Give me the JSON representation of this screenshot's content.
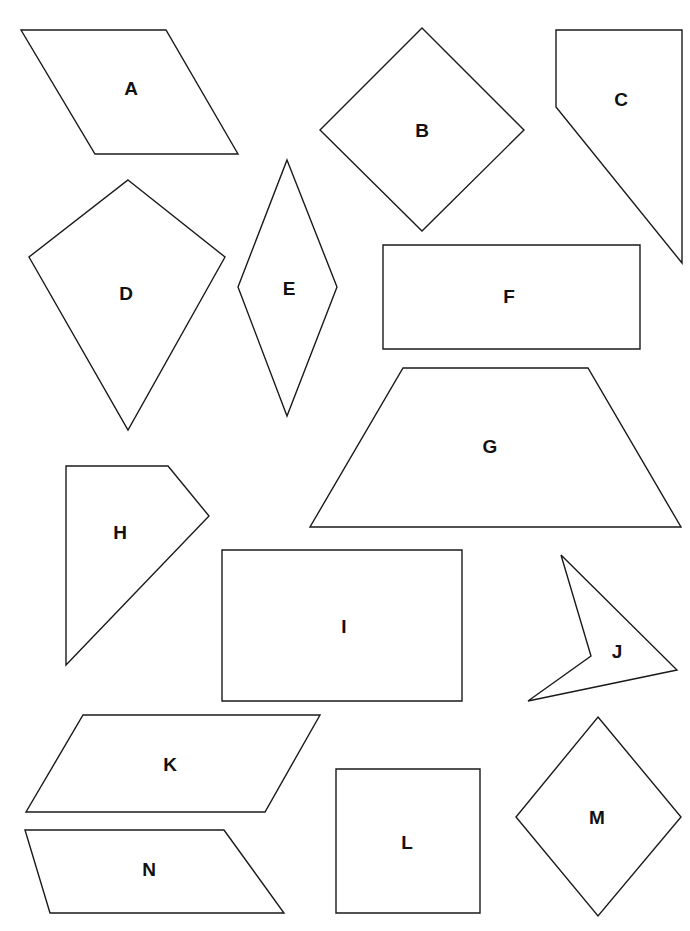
{
  "figure": {
    "width": 690,
    "height": 931,
    "background": "#ffffff",
    "stroke_color": "#1a1a1a",
    "label_color": "#111111"
  },
  "shapes": [
    {
      "label": "A",
      "kind": "parallelogram",
      "points": [
        [
          21,
          30
        ],
        [
          166,
          30
        ],
        [
          238,
          154
        ],
        [
          95,
          154
        ]
      ],
      "label_pos": [
        131,
        88
      ]
    },
    {
      "label": "B",
      "kind": "square-rotated",
      "points": [
        [
          422,
          28
        ],
        [
          524,
          130
        ],
        [
          422,
          231
        ],
        [
          320,
          130
        ]
      ],
      "label_pos": [
        422,
        130
      ]
    },
    {
      "label": "C",
      "kind": "quadrilateral",
      "points": [
        [
          556,
          30
        ],
        [
          682,
          30
        ],
        [
          682,
          263
        ],
        [
          556,
          107
        ]
      ],
      "label_pos": [
        621,
        99
      ]
    },
    {
      "label": "D",
      "kind": "kite",
      "points": [
        [
          128,
          180
        ],
        [
          225,
          257
        ],
        [
          128,
          430
        ],
        [
          29,
          257
        ]
      ],
      "label_pos": [
        126,
        293
      ]
    },
    {
      "label": "E",
      "kind": "rhombus",
      "points": [
        [
          287,
          160
        ],
        [
          337,
          287
        ],
        [
          287,
          416
        ],
        [
          238,
          287
        ]
      ],
      "label_pos": [
        289,
        288
      ]
    },
    {
      "label": "F",
      "kind": "rectangle",
      "points": [
        [
          383,
          245
        ],
        [
          640,
          245
        ],
        [
          640,
          349
        ],
        [
          383,
          349
        ]
      ],
      "label_pos": [
        509,
        296
      ]
    },
    {
      "label": "G",
      "kind": "trapezoid",
      "points": [
        [
          403,
          368
        ],
        [
          588,
          368
        ],
        [
          681,
          527
        ],
        [
          310,
          527
        ]
      ],
      "label_pos": [
        490,
        446
      ]
    },
    {
      "label": "H",
      "kind": "pentagon",
      "points": [
        [
          66,
          466
        ],
        [
          168,
          466
        ],
        [
          209,
          516
        ],
        [
          66,
          665
        ]
      ],
      "label_pos": [
        120,
        532
      ]
    },
    {
      "label": "I",
      "kind": "rectangle",
      "points": [
        [
          222,
          550
        ],
        [
          462,
          550
        ],
        [
          462,
          701
        ],
        [
          222,
          701
        ]
      ],
      "label_pos": [
        344,
        626
      ]
    },
    {
      "label": "J",
      "kind": "concave-quadrilateral",
      "points": [
        [
          561,
          555
        ],
        [
          677,
          670
        ],
        [
          528,
          701
        ],
        [
          591,
          656
        ]
      ],
      "label_pos": [
        617,
        651
      ]
    },
    {
      "label": "K",
      "kind": "parallelogram",
      "points": [
        [
          83,
          715
        ],
        [
          320,
          715
        ],
        [
          265,
          812
        ],
        [
          26,
          812
        ]
      ],
      "label_pos": [
        170,
        764
      ]
    },
    {
      "label": "L",
      "kind": "square",
      "points": [
        [
          336,
          769
        ],
        [
          480,
          769
        ],
        [
          480,
          913
        ],
        [
          336,
          913
        ]
      ],
      "label_pos": [
        407,
        842
      ]
    },
    {
      "label": "M",
      "kind": "rhombus",
      "points": [
        [
          598,
          717
        ],
        [
          681,
          817
        ],
        [
          598,
          916
        ],
        [
          516,
          817
        ]
      ],
      "label_pos": [
        597,
        817
      ]
    },
    {
      "label": "N",
      "kind": "trapezoid",
      "points": [
        [
          25,
          830
        ],
        [
          224,
          830
        ],
        [
          284,
          913
        ],
        [
          50,
          913
        ]
      ],
      "label_pos": [
        149,
        869
      ]
    }
  ]
}
